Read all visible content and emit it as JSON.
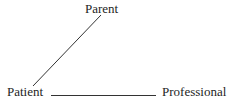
{
  "diagram": {
    "type": "relationship-triangle",
    "nodes": [
      {
        "id": "parent",
        "label": "Parent"
      },
      {
        "id": "patient",
        "label": "Patient"
      },
      {
        "id": "professional",
        "label": "Professional"
      }
    ],
    "edges": [
      {
        "from": "patient",
        "to": "parent",
        "style": "solid"
      },
      {
        "from": "patient",
        "to": "professional",
        "style": "solid"
      }
    ],
    "line_color": "#333333",
    "text_color": "#1e1e1e"
  }
}
